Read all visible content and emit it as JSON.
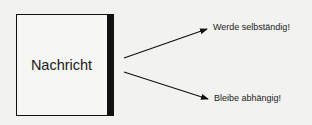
{
  "box": {
    "label": "Nachricht"
  },
  "outputs": [
    {
      "label": "Werde selbständig!"
    },
    {
      "label": "Bleibe abhängig!"
    }
  ],
  "colors": {
    "background": "#f2f2f0",
    "ink": "#111111"
  }
}
